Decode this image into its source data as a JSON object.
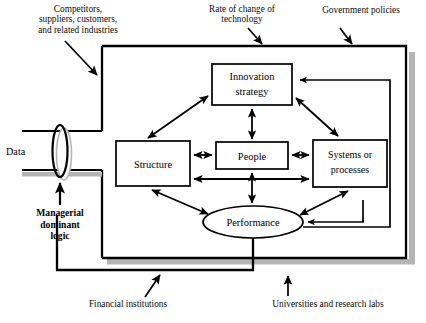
{
  "figure": {
    "kind": "conceptual-block-diagram",
    "title_visible": false
  },
  "external_labels": [
    {
      "id": "competitors",
      "text": "Competitors,\nsuppliers, customers,\nand related industries",
      "position": "top-left"
    },
    {
      "id": "rate-of-change",
      "text": "Rate of change of\ntechnology",
      "position": "top-center"
    },
    {
      "id": "government-policies",
      "text": "Government policies",
      "position": "top-right"
    },
    {
      "id": "financial-institutions",
      "text": "Financial institutions",
      "position": "bottom-left"
    },
    {
      "id": "universities",
      "text": "Universities and research labs",
      "position": "bottom-right"
    }
  ],
  "input_channel": {
    "data_label": "Data",
    "filter_label": "Managerial\ndominant\nlogic",
    "filter_shape": "vertical-ellipse-valve"
  },
  "nodes": [
    {
      "id": "innovation-strategy",
      "label": "Innovation\nstrategy",
      "shape": "rect",
      "x": 212,
      "y": 64,
      "w": 80,
      "h": 41
    },
    {
      "id": "structure",
      "label": "Structure",
      "shape": "rect",
      "x": 116,
      "y": 141,
      "w": 74,
      "h": 45
    },
    {
      "id": "people",
      "label": "People",
      "shape": "rect",
      "x": 216,
      "y": 142,
      "w": 72,
      "h": 27
    },
    {
      "id": "systems-processes",
      "label": "Systems or\nprocesses",
      "shape": "rect",
      "x": 313,
      "y": 140,
      "w": 74,
      "h": 47
    },
    {
      "id": "performance",
      "label": "Performance",
      "shape": "ellipse",
      "cx": 253,
      "cy": 222,
      "rx": 50,
      "ry": 16
    }
  ],
  "connections": [
    {
      "from": "structure",
      "to": "innovation-strategy",
      "type": "double-headed"
    },
    {
      "from": "innovation-strategy",
      "to": "people",
      "type": "double-headed"
    },
    {
      "from": "innovation-strategy",
      "to": "systems-processes",
      "type": "double-headed"
    },
    {
      "from": "structure",
      "to": "people",
      "type": "double-headed"
    },
    {
      "from": "people",
      "to": "systems-processes",
      "type": "double-headed"
    },
    {
      "from": "structure",
      "to": "systems-processes",
      "type": "double-headed"
    },
    {
      "from": "people",
      "to": "performance",
      "type": "double-headed"
    },
    {
      "from": "structure",
      "to": "performance",
      "type": "double-headed"
    },
    {
      "from": "systems-processes",
      "to": "performance",
      "type": "double-headed"
    },
    {
      "from": "performance",
      "to": "innovation-strategy",
      "type": "feedback-right-loop"
    },
    {
      "from": "performance",
      "to": "systems-processes",
      "type": "feedback-right-inner"
    },
    {
      "from": "performance",
      "to": "input-channel",
      "type": "feedback-bottom-left-loop"
    }
  ],
  "colors": {
    "line": "#000000",
    "shadow": "#b3b3b3",
    "background": "#ffffff",
    "text": "#000000"
  },
  "outer_boundary": {
    "note": "organization boundary box with drop shadow",
    "x": 102,
    "y": 45,
    "w": 304,
    "h": 213
  }
}
